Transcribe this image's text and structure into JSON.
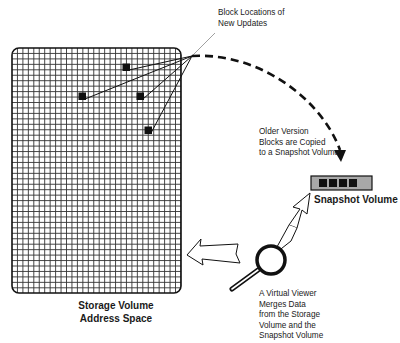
{
  "labels": {
    "block_locations": "Block Locations of\nNew Updates",
    "older_version": "Older Version\nBlocks are Copied\nto a Snapshot Volume",
    "snapshot_volume": "Snapshot Volume",
    "virtual_viewer": "A Virtual Viewer\nMerges Data\nfrom the Storage\nVolume and the\nSnapshot Volume",
    "storage_volume": "Storage Volume\nAddress Space"
  },
  "storage_grid": {
    "x": 12,
    "y": 48,
    "width": 169,
    "height": 245,
    "cell": 5.45,
    "updated_blocks": [
      {
        "x": 126,
        "y": 67
      },
      {
        "x": 82,
        "y": 96
      },
      {
        "x": 140,
        "y": 96
      },
      {
        "x": 148,
        "y": 130
      }
    ]
  },
  "snapshot_volume_blocks": 4,
  "colors": {
    "ink": "#111111",
    "grid_line": "#333333",
    "snapshot_fill": "#a8a8a8",
    "background": "#ffffff"
  },
  "icons": [
    "magnifier-icon",
    "arrow-left-icon",
    "arrow-up-right-icon",
    "dashed-curve-arrow-icon"
  ]
}
